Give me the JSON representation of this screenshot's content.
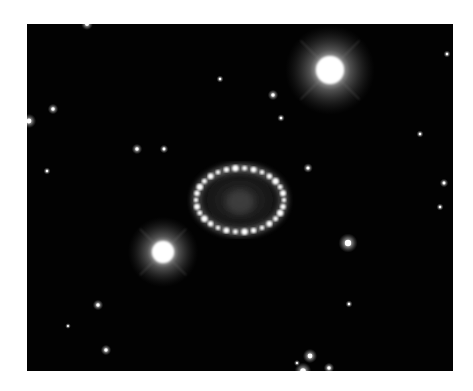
{
  "image": {
    "subject": "supernova remnant ring with two bright foreground stars",
    "background_color": "#020202",
    "page_color": "#ffffff",
    "ring": {
      "cx": 213,
      "cy": 176,
      "rx": 44,
      "ry": 32,
      "beads": 30
    },
    "bright_stars": [
      {
        "x": 303,
        "y": 46,
        "r": 14,
        "spikes": true
      },
      {
        "x": 136,
        "y": 228,
        "r": 11,
        "spikes": true
      }
    ],
    "medium_stars": [
      {
        "x": 321,
        "y": 219,
        "r": 4
      },
      {
        "x": 276,
        "y": 347,
        "r": 3.5
      },
      {
        "x": 283,
        "y": 332,
        "r": 3
      }
    ],
    "small_stars": [
      {
        "x": 60,
        "y": 0,
        "r": 2.5
      },
      {
        "x": 26,
        "y": 85,
        "r": 2.2
      },
      {
        "x": 2,
        "y": 97,
        "r": 3
      },
      {
        "x": 110,
        "y": 125,
        "r": 2.2
      },
      {
        "x": 137,
        "y": 125,
        "r": 1.8
      },
      {
        "x": 193,
        "y": 55,
        "r": 1.5
      },
      {
        "x": 20,
        "y": 147,
        "r": 1.5
      },
      {
        "x": 246,
        "y": 71,
        "r": 2.2
      },
      {
        "x": 254,
        "y": 94,
        "r": 1.6
      },
      {
        "x": 281,
        "y": 144,
        "r": 2
      },
      {
        "x": 417,
        "y": 159,
        "r": 1.8
      },
      {
        "x": 413,
        "y": 183,
        "r": 1.5
      },
      {
        "x": 71,
        "y": 281,
        "r": 2.2
      },
      {
        "x": 79,
        "y": 326,
        "r": 2.2
      },
      {
        "x": 41,
        "y": 302,
        "r": 1.2
      },
      {
        "x": 302,
        "y": 344,
        "r": 2.2
      },
      {
        "x": 322,
        "y": 280,
        "r": 1.5
      },
      {
        "x": 270,
        "y": 339,
        "r": 1.3
      },
      {
        "x": 420,
        "y": 30,
        "r": 1.5
      },
      {
        "x": 393,
        "y": 110,
        "r": 1.5
      }
    ]
  }
}
